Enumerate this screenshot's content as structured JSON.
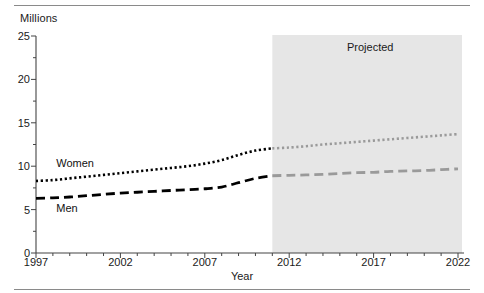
{
  "figure": {
    "y_axis_unit_label": "Millions",
    "x_axis_title": "Year",
    "projected_label": "Projected",
    "women_label": "Women",
    "men_label": "Men"
  },
  "colors": {
    "historical_line": "#000000",
    "projected_line": "#9a9a9a",
    "projected_band": "#e6e6e6",
    "axis": "#444444",
    "rule": "#8a8a8a",
    "text": "#1a1a1a"
  },
  "chart_data": {
    "type": "line",
    "title": "",
    "xlabel": "Year",
    "ylabel": "Millions",
    "xlim": [
      1997,
      2022
    ],
    "ylim": [
      0,
      25
    ],
    "yticks": [
      0,
      5,
      10,
      15,
      20,
      25
    ],
    "xticks": [
      1997,
      2002,
      2007,
      2012,
      2017,
      2022
    ],
    "xtick_labels": [
      "1997",
      "2002",
      "2007",
      "2012",
      "2017",
      "2022"
    ],
    "ytick_labels": [
      "0",
      "5",
      "10",
      "15",
      "20",
      "25"
    ],
    "minor_tick_interval": 1,
    "grid": false,
    "legend": "inline-labels",
    "projection_start_year": 2011,
    "annotations": [
      {
        "text": "Projected",
        "x": 2016.8,
        "y": 23.6
      },
      {
        "text": "Women",
        "x": 1998.2,
        "y": 10.3
      },
      {
        "text": "Men",
        "x": 1998.2,
        "y": 5.1
      }
    ],
    "x": [
      1997,
      1998,
      1999,
      2000,
      2001,
      2002,
      2003,
      2004,
      2005,
      2006,
      2007,
      2008,
      2009,
      2010,
      2011,
      2012,
      2013,
      2014,
      2015,
      2016,
      2017,
      2018,
      2019,
      2020,
      2021,
      2022
    ],
    "series": [
      {
        "name": "Women",
        "style": "dotted",
        "values": [
          8.3,
          8.4,
          8.6,
          8.8,
          9.0,
          9.2,
          9.4,
          9.6,
          9.8,
          10.0,
          10.3,
          10.7,
          11.3,
          11.8,
          12.05,
          12.15,
          12.3,
          12.5,
          12.65,
          12.8,
          12.95,
          13.1,
          13.25,
          13.4,
          13.55,
          13.7
        ]
      },
      {
        "name": "Men",
        "style": "dashed",
        "values": [
          6.3,
          6.35,
          6.45,
          6.6,
          6.75,
          6.9,
          7.0,
          7.1,
          7.2,
          7.3,
          7.4,
          7.6,
          8.1,
          8.6,
          8.9,
          8.95,
          9.0,
          9.05,
          9.15,
          9.25,
          9.3,
          9.4,
          9.45,
          9.5,
          9.6,
          9.7
        ]
      }
    ]
  }
}
